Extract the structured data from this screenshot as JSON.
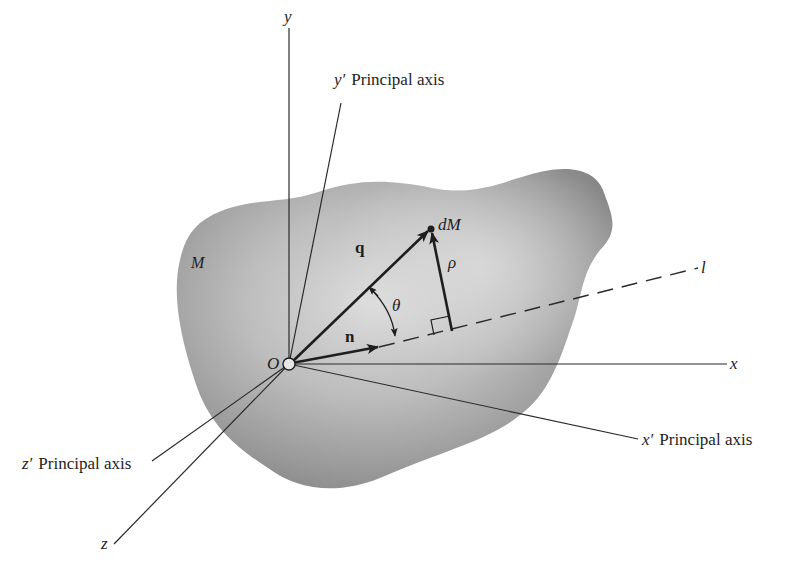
{
  "figure": {
    "body": {
      "label": "M",
      "fill_light": "#d4d4d4",
      "fill_dark": "#8a8a8a"
    },
    "origin": {
      "label": "O",
      "x": 289,
      "y": 364
    },
    "axes": {
      "y": {
        "label": "y",
        "end": [
          289,
          28
        ]
      },
      "x": {
        "label": "x",
        "end": [
          727,
          364
        ]
      },
      "z": {
        "label": "z",
        "end": [
          112,
          545
        ]
      },
      "y_prime": {
        "label": "y′",
        "suffix": "Principal axis",
        "end": [
          341,
          103
        ]
      },
      "x_prime": {
        "label": "x′",
        "suffix": "Principal axis",
        "end": [
          638,
          439
        ]
      },
      "z_prime": {
        "label": "z′",
        "suffix": "Principal axis",
        "end": [
          152,
          461
        ]
      }
    },
    "line_l": {
      "label": "l",
      "end": [
        698,
        267
      ]
    },
    "vectors": {
      "q": {
        "label": "q",
        "end": [
          431,
          229
        ]
      },
      "n": {
        "label": "n",
        "end": [
          379,
          347
        ]
      },
      "rho": {
        "label": "ρ",
        "start": [
          452,
          331
        ],
        "end": [
          431,
          229
        ]
      }
    },
    "mass_element": {
      "label": "dM",
      "x": 431,
      "y": 229
    },
    "angle": {
      "label": "θ"
    },
    "colors": {
      "ink": "#1e1e1e",
      "background": "#ffffff"
    }
  }
}
